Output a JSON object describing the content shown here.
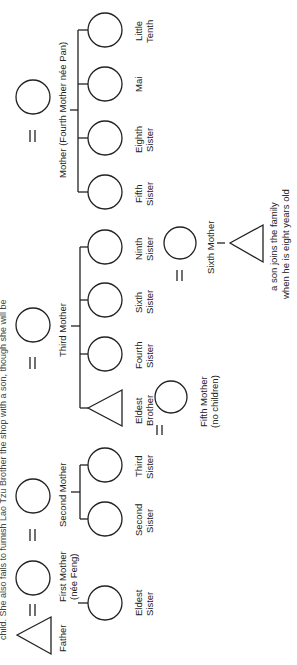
{
  "header": {
    "caption_fragment": "child. She also fails to furnish Lao Tzu Brother the shop with a son, though she will be"
  },
  "people": {
    "father": "Father",
    "first_mother": [
      "First Mother",
      "(née Feng)"
    ],
    "eldest_sister": [
      "Eldest",
      "Sister"
    ],
    "second_mother": "Second Mother",
    "second_sister": [
      "Second",
      "Sister"
    ],
    "third_sister": [
      "Third",
      "Sister"
    ],
    "third_mother": "Third Mother",
    "eldest_brother": [
      "Eldest",
      "Brother"
    ],
    "fourth_sister": [
      "Fourth",
      "Sister"
    ],
    "sixth_sister": [
      "Sixth",
      "Sister"
    ],
    "ninth_sister": [
      "Ninth",
      "Sister"
    ],
    "fifth_mother": [
      "Fifth Mother",
      "(no children)"
    ],
    "sixth_mother": "Sixth Mother",
    "adopted_son": [
      "a son joins the family",
      "when he is eight years old"
    ],
    "mother_fourth": "Mother (Fourth Mother née Pan)",
    "fifth_sister": [
      "Fifth",
      "Sister"
    ],
    "eighth_sister": [
      "Eighth",
      "Sister"
    ],
    "mai": "Mai",
    "little_tenth": [
      "Little",
      "Tenth"
    ]
  },
  "symbols": {
    "marriage": "=",
    "male": "triangle",
    "female": "circle"
  }
}
